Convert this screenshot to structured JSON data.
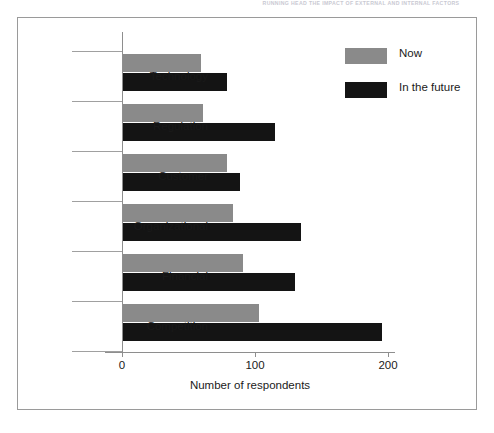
{
  "page_header": "RUNNING HEAD  THE IMPACT OF EXTERNAL AND INTERNAL FACTORS",
  "chart_data": {
    "type": "bar",
    "orientation": "horizontal",
    "title": "",
    "subtitle": "",
    "xlabel": "Number of respondents",
    "ylabel": "",
    "categories": [
      "Technology",
      "Regulation",
      "Customer",
      "Organizational",
      "Financial",
      "Competition"
    ],
    "series": [
      {
        "name": "Now",
        "color": "#8a8a8a",
        "values": [
          59,
          60,
          78,
          83,
          90,
          102
        ]
      },
      {
        "name": "In the future",
        "color": "#141414",
        "values": [
          78,
          114,
          88,
          134,
          129,
          195
        ]
      }
    ],
    "xlim": [
      0,
      210
    ],
    "xticks": [
      0,
      100,
      200
    ],
    "xtick_labels": [
      "0",
      "100",
      "200"
    ],
    "grid": false,
    "legend_position": "top-right",
    "frame": true
  },
  "legend": {
    "items": [
      {
        "label": "Now",
        "swatch": "now"
      },
      {
        "label": "In the future",
        "swatch": "future"
      }
    ]
  },
  "axis": {
    "x_title": "Number of respondents",
    "tick_labels": [
      "0",
      "100",
      "200"
    ]
  }
}
